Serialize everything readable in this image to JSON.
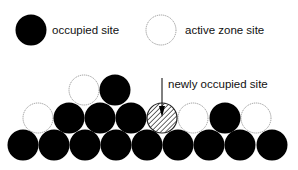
{
  "legend": {
    "occupied": {
      "label": "occupied site",
      "cx": 31,
      "cy": 30
    },
    "active": {
      "label": "active zone site",
      "cx": 161,
      "cy": 30
    }
  },
  "annotation": {
    "label": "newly occupied site",
    "text_x": 168,
    "text_y": 88,
    "arrow_x": 162,
    "arrow_y1": 78,
    "arrow_y2": 116
  },
  "colors": {
    "occupied": "#000000",
    "active_stroke": "#888888",
    "new_hatch": "#555555",
    "background": "#ffffff"
  },
  "radius": 15.5,
  "sites": [
    {
      "row": 0,
      "cx": 23,
      "cy": 145,
      "type": "occupied"
    },
    {
      "row": 0,
      "cx": 54,
      "cy": 145,
      "type": "occupied"
    },
    {
      "row": 0,
      "cx": 85,
      "cy": 145,
      "type": "occupied"
    },
    {
      "row": 0,
      "cx": 116,
      "cy": 145,
      "type": "occupied"
    },
    {
      "row": 0,
      "cx": 147,
      "cy": 145,
      "type": "occupied"
    },
    {
      "row": 0,
      "cx": 178,
      "cy": 145,
      "type": "occupied"
    },
    {
      "row": 0,
      "cx": 209,
      "cy": 145,
      "type": "occupied"
    },
    {
      "row": 0,
      "cx": 240,
      "cy": 145,
      "type": "occupied"
    },
    {
      "row": 0,
      "cx": 272,
      "cy": 145,
      "type": "occupied"
    },
    {
      "row": 1,
      "cx": 38,
      "cy": 118,
      "type": "active"
    },
    {
      "row": 1,
      "cx": 69,
      "cy": 118,
      "type": "occupied"
    },
    {
      "row": 1,
      "cx": 100,
      "cy": 118,
      "type": "occupied"
    },
    {
      "row": 1,
      "cx": 131,
      "cy": 118,
      "type": "occupied"
    },
    {
      "row": 1,
      "cx": 162,
      "cy": 118,
      "type": "new"
    },
    {
      "row": 1,
      "cx": 193,
      "cy": 118,
      "type": "active"
    },
    {
      "row": 1,
      "cx": 225,
      "cy": 118,
      "type": "occupied"
    },
    {
      "row": 1,
      "cx": 256,
      "cy": 118,
      "type": "active"
    },
    {
      "row": 2,
      "cx": 84,
      "cy": 90,
      "type": "active"
    },
    {
      "row": 2,
      "cx": 115,
      "cy": 90,
      "type": "occupied"
    }
  ]
}
